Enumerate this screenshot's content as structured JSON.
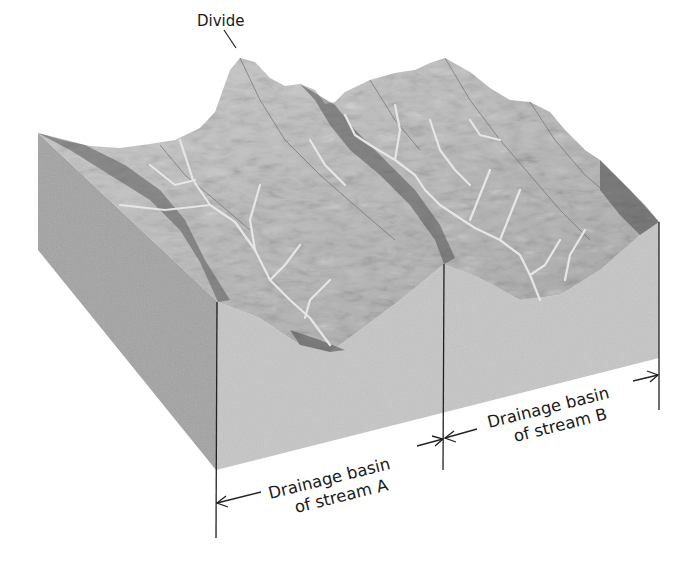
{
  "figure": {
    "type": "block diagram"
  },
  "labels": {
    "divide": "Divide",
    "basin_a": {
      "line1": "Drainage basin",
      "line2": "of stream A"
    },
    "basin_b": {
      "line1": "Drainage basin",
      "line2": "of stream B"
    }
  },
  "colors": {
    "side_face": "#a3a3a3",
    "front_face": "#c4c4c4",
    "terrain_light": "#d9d9d9",
    "terrain_mid": "#9a9a9a",
    "terrain_dark": "#4a4a4a",
    "stream": "#e8e8e8",
    "lines": "#222222",
    "background": "#ffffff"
  }
}
